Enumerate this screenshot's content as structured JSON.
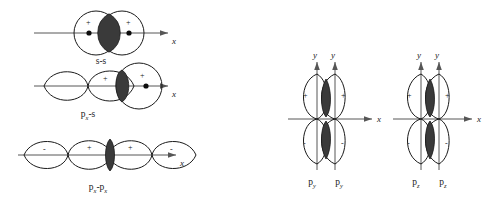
{
  "figure": {
    "colors": {
      "outline": "#1a1a1a",
      "axis": "#565656",
      "overlap_fill": "#3a3a3a",
      "background": "#ffffff"
    }
  },
  "sigma_group": {
    "diagrams": [
      {
        "id": "s-s",
        "label": "s-s",
        "axis_label": "x",
        "type": "two-circles",
        "signs": [
          "+",
          "+"
        ],
        "nuclei": 2,
        "overlap": "lens"
      },
      {
        "id": "px-s",
        "label_main": "p",
        "label_sub": "x",
        "label_tail": "-s",
        "axis_label": "x",
        "type": "p-lobe-plus-circle",
        "signs": [
          "+",
          "+"
        ],
        "nuclei": 1,
        "overlap": "lens"
      },
      {
        "id": "px-px",
        "label_main": "p",
        "label_sub": "x",
        "label_tail": "-p",
        "label_sub2": "x",
        "axis_label": "x",
        "type": "two-p-orbitals",
        "signs": [
          "-",
          "+",
          "+",
          "-"
        ],
        "nuclei": 1,
        "overlap": "lens"
      }
    ]
  },
  "pi_group": {
    "diagrams": [
      {
        "id": "py-py",
        "axis_x_label": "x",
        "axis_y_labels": [
          "y",
          "y"
        ],
        "orbital_main": "p",
        "orbital_sub": "y",
        "signs_top": [
          "+",
          "+"
        ],
        "signs_bottom": [
          "-",
          "-"
        ],
        "overlap": "double-lens"
      },
      {
        "id": "pz-pz",
        "axis_x_label": "x",
        "axis_y_labels": [
          "y",
          "y"
        ],
        "orbital_main": "p",
        "orbital_sub": "z",
        "signs_top": [
          "+",
          "+"
        ],
        "signs_bottom": [
          "-",
          "-"
        ],
        "overlap": "double-lens"
      }
    ]
  }
}
